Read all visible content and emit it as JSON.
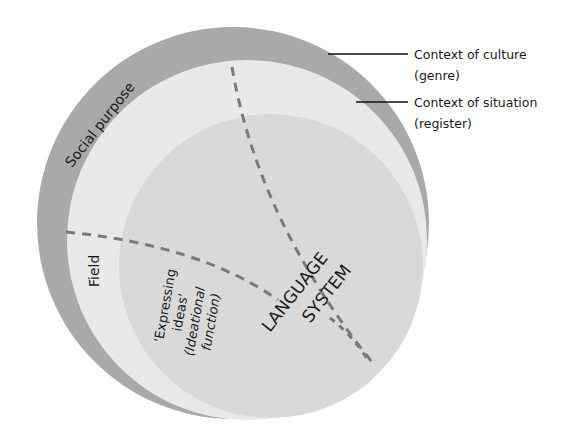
{
  "diagram": {
    "labels": {
      "culture_line1": "Context of culture",
      "culture_line2": "(genre)",
      "situation_line1": "Context of situation",
      "situation_line2": "(register)",
      "social_purpose": "Social purpose",
      "field": "Field",
      "expressing_line1": "'Expressing",
      "expressing_line2": "ideas'",
      "expressing_line3": "(Ideational",
      "expressing_line4": "function)",
      "language_line1": "LANGUAGE",
      "language_line2": "SYSTEM"
    },
    "colors": {
      "outer": "#a9a9a9",
      "middle": "#e9e9e9",
      "inner": "#d9d9d9",
      "dash": "#7a7a7a"
    }
  }
}
